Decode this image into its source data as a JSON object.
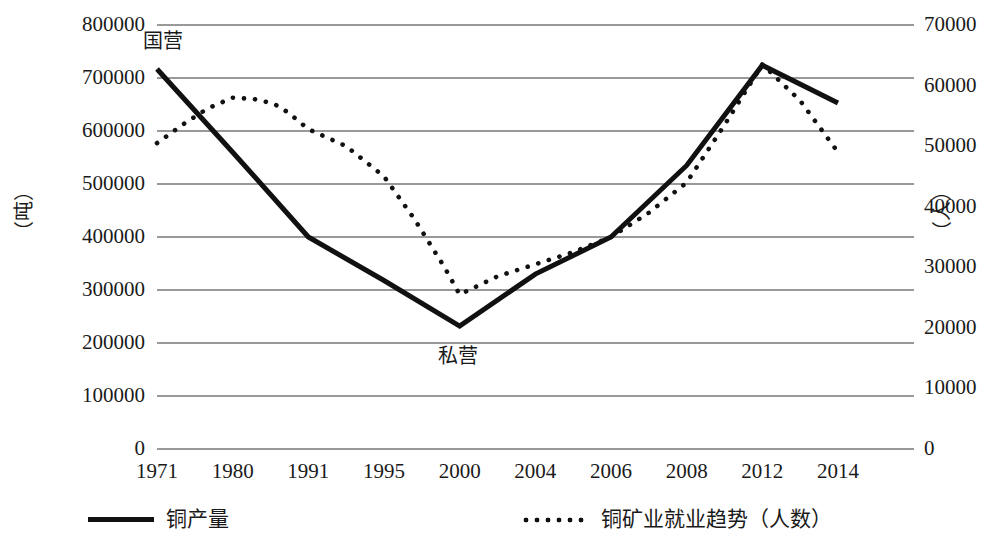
{
  "chart_data": {
    "type": "line",
    "title": "",
    "xlabel": "",
    "ylabel": "（吨）",
    "ylabel_right": "（人）",
    "categories": [
      "1971",
      "1980",
      "1991",
      "1995",
      "2000",
      "2004",
      "2006",
      "2008",
      "2012",
      "2014"
    ],
    "x": [
      1971,
      1980,
      1991,
      1995,
      2000,
      2004,
      2006,
      2008,
      2012,
      2014
    ],
    "ylim": [
      0,
      800000
    ],
    "ylim_right": [
      0,
      70000
    ],
    "yticks": [
      "0",
      "100000",
      "200000",
      "300000",
      "400000",
      "500000",
      "600000",
      "700000",
      "800000"
    ],
    "yticks_right": [
      "0",
      "10000",
      "20000",
      "30000",
      "40000",
      "50000",
      "60000",
      "70000"
    ],
    "grid": true,
    "legend_position": "bottom",
    "series": [
      {
        "name": "铜产量",
        "axis": "left",
        "style": "solid",
        "color": "#111111",
        "values": [
          717000,
          560000,
          400000,
          318000,
          232000,
          330000,
          400000,
          535000,
          724000,
          653000
        ]
      },
      {
        "name": "铜矿业就业趋势（人数）",
        "axis": "right",
        "style": "dotted",
        "color": "#111111",
        "values": [
          50500,
          58000,
          52800,
          45000,
          25500,
          30500,
          35000,
          44000,
          63500,
          49000
        ]
      }
    ],
    "dotted_detail_x": [
      1971,
      1974,
      1977,
      1980,
      1983,
      1986,
      1988,
      1991,
      1993,
      1995,
      1997,
      1999,
      2000,
      2002,
      2004,
      2005,
      2006,
      2007,
      2008,
      2010,
      2012,
      2013,
      2014
    ],
    "dotted_detail_y": [
      50500,
      53500,
      56200,
      58000,
      57800,
      57000,
      55600,
      52800,
      50000,
      45000,
      38000,
      30000,
      25500,
      28500,
      30500,
      32500,
      35000,
      39000,
      44000,
      53500,
      63500,
      57500,
      49000
    ],
    "annotations": [
      {
        "text": "国营",
        "x": 1972,
        "y": 770000,
        "axis": "left"
      },
      {
        "text": "私营",
        "x": 2000,
        "y": 175000,
        "axis": "left"
      }
    ],
    "legend": [
      {
        "label": "铜产量",
        "style": "solid"
      },
      {
        "label": "铜矿业就业趋势（人数）",
        "style": "dotted"
      }
    ]
  }
}
